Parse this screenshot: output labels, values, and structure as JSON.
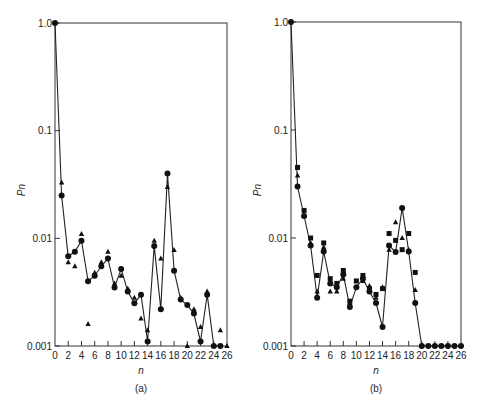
{
  "chart_data": [
    {
      "type": "scatter",
      "panel_label": "(a)",
      "xlabel": "n",
      "ylabel": "P_n",
      "yscale": "log",
      "xlim": [
        0,
        26
      ],
      "ylim": [
        0.001,
        1.0
      ],
      "xticks": [
        "0",
        "2",
        "4",
        "6",
        "8",
        "10",
        "12",
        "14",
        "16",
        "18",
        "20",
        "22",
        "24",
        "26"
      ],
      "yticks": [
        "1.0",
        "0.1",
        "0.01",
        "0.001"
      ],
      "series": [
        {
          "name": "circles",
          "marker": "circle",
          "connected": true,
          "x": [
            0,
            1,
            2,
            3,
            4,
            5,
            6,
            7,
            8,
            9,
            10,
            11,
            12,
            13,
            14,
            15,
            16,
            17,
            18,
            19,
            20,
            21,
            22,
            23,
            24,
            25
          ],
          "y": [
            1.0,
            0.025,
            0.0068,
            0.0075,
            0.0095,
            0.004,
            0.0045,
            0.0055,
            0.0065,
            0.0035,
            0.0052,
            0.0032,
            0.0025,
            0.003,
            0.0011,
            0.0085,
            0.0022,
            0.04,
            0.005,
            0.0027,
            0.0024,
            0.002,
            0.0011,
            0.003,
            0.001,
            0.001
          ]
        },
        {
          "name": "triangles",
          "marker": "triangle",
          "connected": false,
          "x": [
            1,
            2,
            3,
            4,
            5,
            6,
            7,
            8,
            9,
            10,
            11,
            12,
            13,
            14,
            15,
            16,
            17,
            18,
            19,
            20,
            21,
            22,
            23,
            25,
            26
          ],
          "y": [
            0.033,
            0.006,
            0.0055,
            0.011,
            0.0016,
            0.0048,
            0.006,
            0.0075,
            0.0038,
            0.0045,
            0.0034,
            0.0028,
            0.0018,
            0.0014,
            0.0095,
            0.0065,
            0.03,
            0.0078,
            0.0028,
            0.001,
            0.0022,
            0.0015,
            0.0032,
            0.0014,
            0.001
          ]
        }
      ]
    },
    {
      "type": "scatter",
      "panel_label": "(b)",
      "xlabel": "n",
      "ylabel": "P_n",
      "yscale": "log",
      "xlim": [
        0,
        26
      ],
      "ylim": [
        0.001,
        1.0
      ],
      "xticks": [
        "0",
        "2",
        "4",
        "6",
        "8",
        "10",
        "12",
        "14",
        "16",
        "18",
        "20",
        "22",
        "24",
        "26"
      ],
      "yticks": [
        "1.0",
        "0.1",
        "0.01",
        "0.001"
      ],
      "series": [
        {
          "name": "circles",
          "marker": "circle",
          "connected": true,
          "x": [
            0,
            1,
            2,
            3,
            4,
            5,
            6,
            7,
            8,
            9,
            10,
            11,
            12,
            13,
            14,
            15,
            16,
            17,
            18,
            19,
            20,
            21,
            22,
            23,
            24,
            25,
            26
          ],
          "y": [
            1.0,
            0.03,
            0.016,
            0.0085,
            0.0028,
            0.0075,
            0.0038,
            0.0035,
            0.0046,
            0.0023,
            0.0035,
            0.0042,
            0.0032,
            0.0025,
            0.0015,
            0.0085,
            0.0074,
            0.019,
            0.0075,
            0.0025,
            0.001,
            0.001,
            0.001,
            0.001,
            0.001,
            0.001,
            0.001
          ]
        },
        {
          "name": "squares",
          "marker": "square",
          "connected": false,
          "x": [
            1,
            2,
            3,
            4,
            5,
            6,
            7,
            8,
            9,
            10,
            11,
            12,
            13,
            14,
            15,
            16,
            17,
            18,
            19
          ],
          "y": [
            0.045,
            0.018,
            0.01,
            0.0045,
            0.009,
            0.0042,
            0.0038,
            0.005,
            0.0026,
            0.004,
            0.0045,
            0.0034,
            0.003,
            0.0034,
            0.011,
            0.0095,
            0.0078,
            0.011,
            0.0048
          ]
        },
        {
          "name": "triangles",
          "marker": "triangle",
          "connected": false,
          "x": [
            1,
            2,
            3,
            4,
            5,
            6,
            7,
            8,
            9,
            10,
            11,
            12,
            13,
            14,
            15,
            16,
            17,
            18,
            19
          ],
          "y": [
            0.038,
            0.016,
            0.009,
            0.0032,
            0.0082,
            0.0032,
            0.0032,
            0.0042,
            0.0025,
            0.0035,
            0.004,
            0.0036,
            0.0028,
            0.0035,
            0.0078,
            0.014,
            0.01,
            0.0078,
            0.0033
          ]
        }
      ]
    }
  ]
}
